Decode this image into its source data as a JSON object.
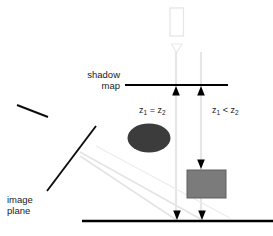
{
  "figure": {
    "labels": {
      "shadow_map": "shadow\nmap",
      "image_plane": "image\nplane",
      "depth_equal_z1": "z",
      "depth_equal_sub1": "1",
      "depth_equal_op": " = ",
      "depth_equal_z2": "z",
      "depth_equal_sub2": "2",
      "depth_less_z1": "z",
      "depth_less_sub1": "1",
      "depth_less_op": " < ",
      "depth_less_z2": "z",
      "depth_less_sub2": "2",
      "depth_equal_full": "z1 = z2",
      "depth_less_full": "z1 < z2"
    },
    "elements": {
      "light_source": "light-source",
      "shadow_map_plane": "shadow-map-plane",
      "ground_plane": "ground-plane",
      "occluder": "occluder-ellipse",
      "receiver": "receiver-rectangle",
      "image_plane_line": "image-plane-line",
      "view_rays": "view-rays",
      "light_rays": "light-rays"
    },
    "colors": {
      "ink": "#000000",
      "text": "#1a1a1a",
      "occluder_fill": "#3c3c3c",
      "receiver_fill": "#7b7b7b",
      "receiver_stroke": "#5a5a5a",
      "light_source_stroke": "#e8e8e8",
      "ray_light": "#e2e2e2",
      "ray_view": "#e6e6e6",
      "background": "#ffffff"
    },
    "geometry": {
      "shadow_map_line": {
        "x1": 125,
        "y1": 85,
        "x2": 228,
        "y2": 85
      },
      "ground_line": {
        "x1": 82,
        "y1": 221,
        "x2": 273,
        "y2": 221
      },
      "ray_left_x": 176,
      "ray_right_x": 201,
      "occluder": {
        "cx": 149,
        "cy": 138,
        "rx": 21,
        "ry": 14
      },
      "receiver": {
        "x": 187,
        "y": 170,
        "w": 39,
        "h": 28
      },
      "image_plane": {
        "x1": 96,
        "y1": 126,
        "x2": 47,
        "y2": 191
      },
      "tick_mark": {
        "x1": 17,
        "y1": 105,
        "x2": 48,
        "y2": 117
      },
      "light_source_box": {
        "x": 170,
        "y": 8,
        "w": 13,
        "h": 28
      }
    }
  }
}
